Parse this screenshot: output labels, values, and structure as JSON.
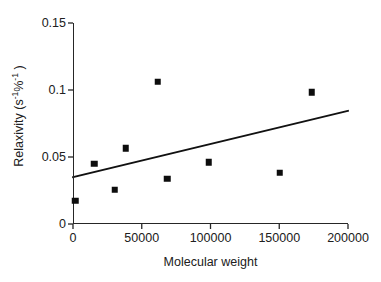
{
  "chart_data": {
    "type": "scatter",
    "title": "",
    "xlabel": "Molecular weight",
    "ylabel": "Relaxivity (s-1%-1)",
    "ylabel_parts": {
      "base": "Relaxivity (s",
      "sup1": "-1",
      "mid": "%",
      "sup2": "-1",
      "tail": " )"
    },
    "xlim": [
      0,
      200000
    ],
    "ylim": [
      0,
      0.15
    ],
    "xticks": [
      0,
      50000,
      100000,
      150000,
      200000
    ],
    "xtick_labels": [
      "0",
      "50000",
      "100000",
      "150000",
      "200000"
    ],
    "yticks": [
      0,
      0.05,
      0.1,
      0.15
    ],
    "ytick_labels": [
      "0",
      "0.05",
      "0.1",
      "0.15"
    ],
    "grid": false,
    "legend": null,
    "marker_style": "filled-square",
    "marker_color": "#0d0d0d",
    "axis_color": "#262626",
    "points": [
      {
        "x": 1500,
        "y": 0.0172
      },
      {
        "x": 15300,
        "y": 0.0448
      },
      {
        "x": 30500,
        "y": 0.0254
      },
      {
        "x": 38500,
        "y": 0.0565
      },
      {
        "x": 61800,
        "y": 0.106
      },
      {
        "x": 68400,
        "y": 0.0336
      },
      {
        "x": 98900,
        "y": 0.0462
      },
      {
        "x": 150500,
        "y": 0.0381
      },
      {
        "x": 173800,
        "y": 0.0985
      }
    ],
    "trend_line": {
      "type": "linear-fit",
      "x_start": 0,
      "y_start": 0.035,
      "x_end": 200000,
      "y_end": 0.0845,
      "color": "#111111"
    }
  }
}
